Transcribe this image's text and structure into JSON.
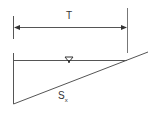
{
  "diagram": {
    "labels": {
      "top_width": "T",
      "cross_slope_main": "S",
      "cross_slope_sub": "x"
    },
    "symbols": {
      "water_surface": "water-surface-triangle"
    },
    "colors": {
      "line": "#555555",
      "text": "#333333"
    }
  }
}
